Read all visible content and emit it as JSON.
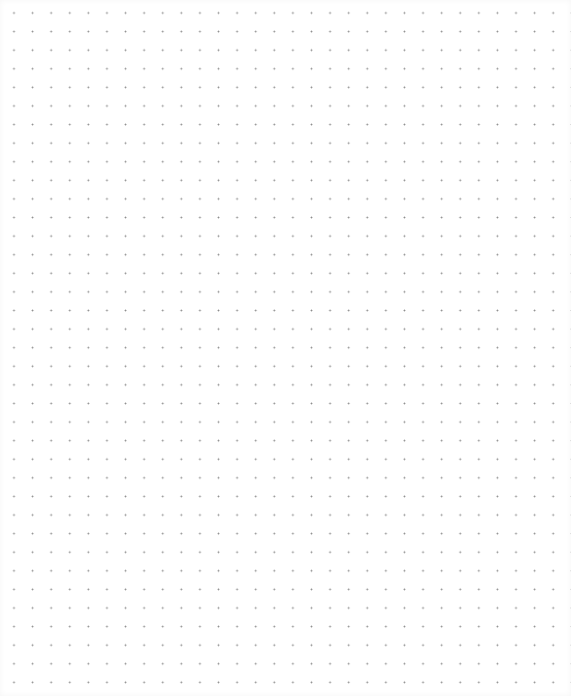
{
  "canvas": {
    "type": "dot-grid",
    "background_color": "#ffffff",
    "dot_color": "#8a8a8a",
    "dot_spacing_px": 18.6,
    "columns": 31,
    "rows": 37
  }
}
